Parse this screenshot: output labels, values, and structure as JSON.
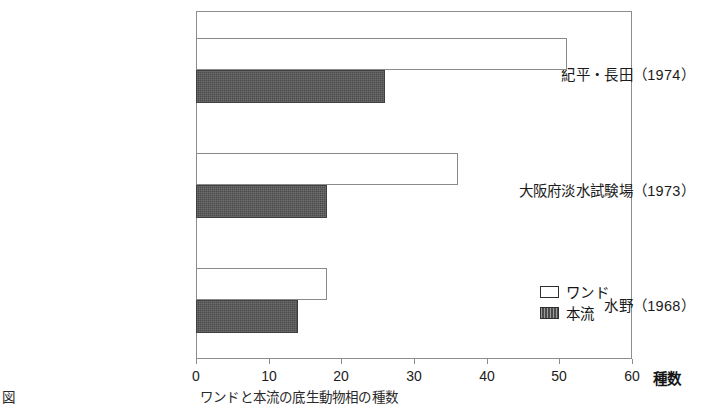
{
  "figure": {
    "caption": "図　　　　　　　　　　　　　　ワンドと本流の底生動物相の種数",
    "caption_note": "partially cropped at bottom edge"
  },
  "chart_data": {
    "type": "bar",
    "orientation": "horizontal",
    "title": "",
    "xlabel": "種数",
    "ylabel": "",
    "xlim": [
      0,
      60
    ],
    "xticks": [
      0,
      10,
      20,
      30,
      40,
      50,
      60
    ],
    "xtick_labels": [
      "0",
      "10",
      "20",
      "30",
      "40",
      "50",
      "60"
    ],
    "grid": false,
    "legend_position": "inside-bottom-right",
    "categories": [
      "紀平・長田（1974）",
      "大阪府淡水試験場（1973）",
      "水野（1968）"
    ],
    "series": [
      {
        "name": "ワンド",
        "values": [
          51,
          36,
          18
        ],
        "color": "#ffffff",
        "edge_color": "#8a8a8a",
        "fill": "open"
      },
      {
        "name": "本流",
        "values": [
          26,
          18,
          14
        ],
        "color": "#4b4b4b",
        "edge_color": "#3f3f3f",
        "fill": "hatched-dark"
      }
    ]
  },
  "axis": {
    "unit_label": "種数",
    "ticks": [
      {
        "value": "0"
      },
      {
        "value": "10"
      },
      {
        "value": "20"
      },
      {
        "value": "30"
      },
      {
        "value": "40"
      },
      {
        "value": "50"
      },
      {
        "value": "60"
      }
    ]
  },
  "legend": {
    "items": [
      {
        "label": "ワンド",
        "swatch": "open-square-icon"
      },
      {
        "label": "本流",
        "swatch": "filled-hatched-square-icon"
      }
    ]
  },
  "groups": [
    {
      "label": "紀平・長田（1974）",
      "wando": 51,
      "honryu": 26
    },
    {
      "label": "大阪府淡水試験場（1973）",
      "wando": 36,
      "honryu": 18
    },
    {
      "label": "水野（1968）",
      "wando": 18,
      "honryu": 14
    }
  ]
}
